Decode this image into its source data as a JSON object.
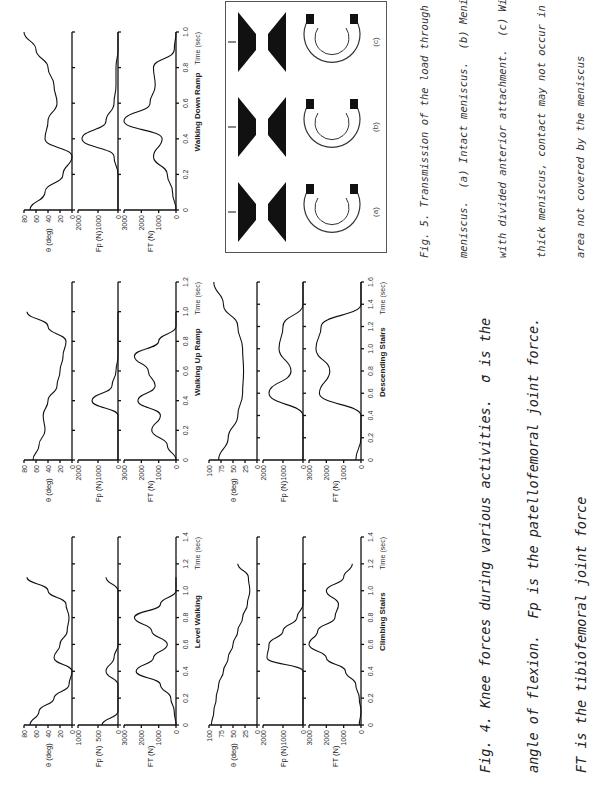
{
  "figure4": {
    "caption_lines": [
      "Fig. 4. Knee forces during various activities.  σ is the",
      "angle of flexion.  Fp is the patellofemoral joint force.",
      "FT is the tibiofemoral joint force"
    ],
    "panels": [
      {
        "name": "level-walking",
        "title": "Level  Walking",
        "time_label": "Time (sec)",
        "x_ticks": [
          "0",
          "0.2",
          "0.4",
          "0.6",
          "0.8",
          "1.0",
          "1.2",
          "1.4"
        ]
      },
      {
        "name": "climbing-stairs",
        "title": "Climbing   Stairs",
        "time_label": "Time (sec)",
        "x_ticks": [
          "0",
          "0.2",
          "0.4",
          "0.6",
          "0.8",
          "1.0",
          "1.2",
          "1.4"
        ]
      },
      {
        "name": "walking-up-ramp",
        "title": "Walking   Up   Ramp",
        "time_label": "Time (sec)",
        "x_ticks": [
          "0",
          "0.2",
          "0.4",
          "0.6",
          "0.8",
          "1.0",
          "1.2"
        ]
      },
      {
        "name": "descending-stairs",
        "title": "Descending   Stairs",
        "time_label": "Time (sec)",
        "x_ticks": [
          "0",
          "0.2",
          "0.4",
          "0.6",
          "0.8",
          "1.0",
          "1.2",
          "1.4",
          "1.6"
        ]
      },
      {
        "name": "walking-down-ramp",
        "title": "Walking   Down   Ramp",
        "time_label": "Time (sec)",
        "x_ticks": [
          "0",
          "0.2",
          "0.4",
          "0.6",
          "0.8",
          "1.0"
        ]
      }
    ],
    "y_labels": {
      "theta": "θ (deg)",
      "fp": "Fp (N)",
      "ft": "FT (N)"
    }
  },
  "figure5": {
    "caption_lines": [
      "Fig. 5. Transmission of the load through the",
      "meniscus.  (a) Intact meniscus.  (b) Meniscus",
      "with divided anterior attachment.  (c) With a",
      "thick meniscus, contact may not occur in the",
      "area not covered by the meniscus"
    ],
    "sublabels": [
      "(a)",
      "(b)",
      "(c)"
    ]
  },
  "chart_data": [
    {
      "type": "line",
      "title": "Level Walking",
      "xlabel": "Time (sec)",
      "x": [
        0,
        0.1,
        0.2,
        0.3,
        0.4,
        0.5,
        0.6,
        0.7,
        0.8,
        0.9,
        1.0,
        1.1
      ],
      "series": [
        {
          "name": "θ (deg)",
          "ylim": [
            0,
            80
          ],
          "values": [
            70,
            55,
            30,
            5,
            0,
            30,
            20,
            8,
            5,
            10,
            40,
            75
          ]
        },
        {
          "name": "Fp (N)",
          "ylim": [
            0,
            1000
          ],
          "values": [
            400,
            0,
            0,
            0,
            300,
            100,
            0,
            0,
            0,
            0,
            0,
            300
          ]
        },
        {
          "name": "FT (N)",
          "ylim": [
            0,
            3000
          ],
          "values": [
            0,
            100,
            300,
            900,
            2300,
            1300,
            500,
            1400,
            2400,
            900,
            0,
            0
          ]
        }
      ]
    },
    {
      "type": "line",
      "title": "Climbing Stairs",
      "xlabel": "Time (sec)",
      "x": [
        0,
        0.1,
        0.2,
        0.3,
        0.4,
        0.5,
        0.6,
        0.7,
        0.8,
        0.9,
        1.0,
        1.1,
        1.2
      ],
      "series": [
        {
          "name": "θ (deg)",
          "ylim": [
            0,
            100
          ],
          "values": [
            95,
            90,
            85,
            80,
            70,
            60,
            50,
            40,
            30,
            20,
            15,
            18,
            40
          ]
        },
        {
          "name": "Fp (N)",
          "ylim": [
            0,
            2000
          ],
          "values": [
            0,
            0,
            0,
            0,
            0,
            1800,
            1700,
            1000,
            300,
            0,
            0,
            0,
            0
          ]
        },
        {
          "name": "FT (N)",
          "ylim": [
            0,
            3000
          ],
          "values": [
            100,
            0,
            100,
            300,
            900,
            2000,
            3300,
            2500,
            1500,
            1300,
            2000,
            1000,
            500
          ]
        }
      ]
    },
    {
      "type": "line",
      "title": "Walking Up Ramp",
      "xlabel": "Time (sec)",
      "x": [
        0,
        0.1,
        0.2,
        0.3,
        0.4,
        0.5,
        0.6,
        0.7,
        0.8,
        0.9,
        1.0
      ],
      "series": [
        {
          "name": "θ (deg)",
          "ylim": [
            0,
            80
          ],
          "values": [
            65,
            55,
            45,
            48,
            40,
            25,
            20,
            15,
            10,
            40,
            75
          ]
        },
        {
          "name": "Fp (N)",
          "ylim": [
            0,
            2000
          ],
          "values": [
            0,
            0,
            0,
            0,
            1300,
            300,
            100,
            0,
            0,
            0,
            0
          ]
        },
        {
          "name": "FT (N)",
          "ylim": [
            0,
            3000
          ],
          "values": [
            0,
            500,
            1400,
            900,
            2200,
            1200,
            1600,
            2400,
            1000,
            0,
            0
          ]
        }
      ]
    },
    {
      "type": "line",
      "title": "Descending Stairs",
      "xlabel": "Time (sec)",
      "x": [
        0,
        0.2,
        0.4,
        0.6,
        0.8,
        1.0,
        1.2,
        1.4,
        1.6
      ],
      "series": [
        {
          "name": "θ (deg)",
          "ylim": [
            0,
            100
          ],
          "values": [
            80,
            60,
            40,
            30,
            28,
            30,
            40,
            70,
            90
          ]
        },
        {
          "name": "Fp (N)",
          "ylim": [
            0,
            2000
          ],
          "values": [
            0,
            0,
            0,
            1700,
            600,
            1200,
            1000,
            0,
            0
          ]
        },
        {
          "name": "FT (N)",
          "ylim": [
            0,
            3000
          ],
          "values": [
            300,
            0,
            0,
            2400,
            1800,
            2600,
            2300,
            0,
            0
          ]
        }
      ]
    },
    {
      "type": "line",
      "title": "Walking Down Ramp",
      "xlabel": "Time (sec)",
      "x": [
        0,
        0.1,
        0.2,
        0.3,
        0.4,
        0.5,
        0.6,
        0.7,
        0.8,
        0.9,
        1.0
      ],
      "series": [
        {
          "name": "θ (deg)",
          "ylim": [
            0,
            80
          ],
          "values": [
            70,
            45,
            15,
            0,
            45,
            40,
            25,
            30,
            40,
            60,
            80
          ]
        },
        {
          "name": "Fp (N)",
          "ylim": [
            0,
            2000
          ],
          "values": [
            0,
            0,
            0,
            200,
            1800,
            600,
            200,
            100,
            100,
            0,
            0
          ]
        },
        {
          "name": "FT (N)",
          "ylim": [
            0,
            3000
          ],
          "values": [
            0,
            200,
            500,
            1300,
            800,
            3600,
            1500,
            1200,
            1300,
            100,
            0
          ]
        }
      ]
    }
  ]
}
